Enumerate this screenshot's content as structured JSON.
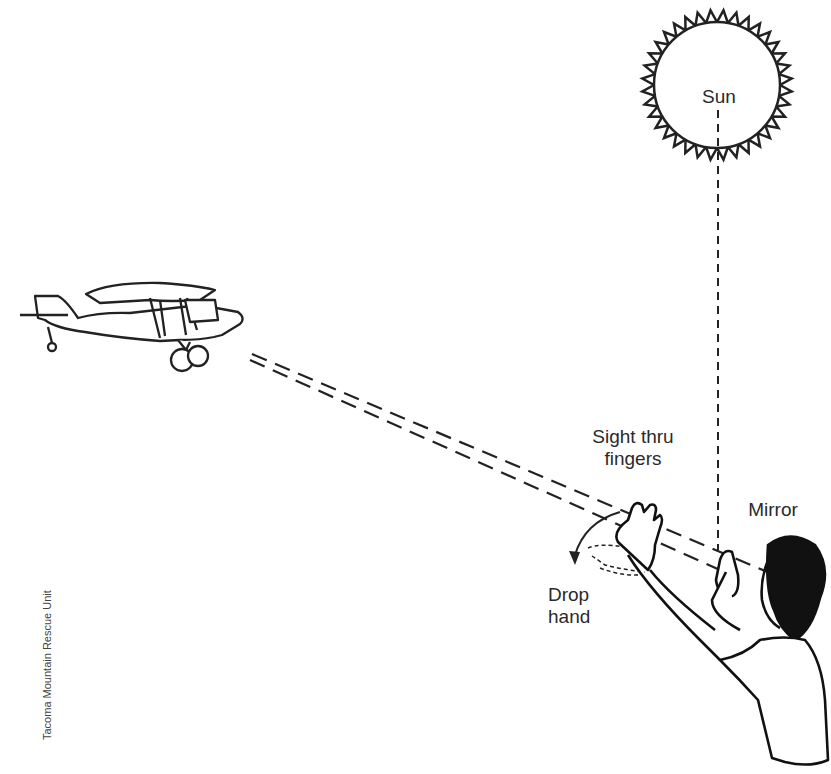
{
  "diagram": {
    "labels": {
      "sun": "Sun",
      "sight": "Sight thru fingers",
      "sight_line1": "Sight thru",
      "sight_line2": "fingers",
      "mirror": "Mirror",
      "drop_line1": "Drop",
      "drop_line2": "hand"
    },
    "credit": "Tacoma Mountain Rescue Unit",
    "elements": [
      "sun-icon",
      "airplane-icon",
      "person-with-mirror",
      "sight-lines",
      "sun-ray"
    ],
    "colors": {
      "ink": "#222222",
      "background": "#ffffff"
    }
  }
}
